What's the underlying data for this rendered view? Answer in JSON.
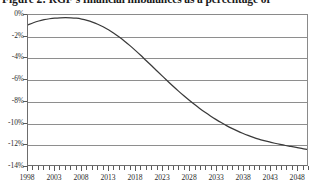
{
  "figure": {
    "title": "Figure 2: RGF's financial imbalances as a percentage of"
  },
  "chart_data": {
    "type": "line",
    "title": "Figure 2: RGF's financial imbalances as a percentage of",
    "xlabel": "",
    "ylabel": "",
    "xlim": [
      1998,
      2050
    ],
    "ylim": [
      -14,
      0
    ],
    "grid": true,
    "legend": null,
    "ytick_labels": [
      "0%",
      "-2%",
      "-4%",
      "-6%",
      "-8%",
      "-10%",
      "-12%",
      "-14%"
    ],
    "ytick_values": [
      0,
      -2,
      -4,
      -6,
      -8,
      -10,
      -12,
      -14
    ],
    "xtick_labels": [
      "1998",
      "2003",
      "2008",
      "2013",
      "2018",
      "2023",
      "2028",
      "2033",
      "2038",
      "2043",
      "2048"
    ],
    "xtick_values": [
      1998,
      2003,
      2008,
      2013,
      2018,
      2023,
      2028,
      2033,
      2038,
      2043,
      2048
    ],
    "x_minor_tick_step": 1,
    "line_color": "#3a3a3a",
    "grid_color": "#8e8e8e",
    "series": [
      {
        "name": "RGF financial imbalance",
        "x": [
          1998,
          1999,
          2000,
          2001,
          2002,
          2003,
          2004,
          2005,
          2006,
          2007,
          2008,
          2009,
          2010,
          2011,
          2012,
          2013,
          2014,
          2015,
          2016,
          2017,
          2018,
          2019,
          2020,
          2021,
          2022,
          2023,
          2024,
          2025,
          2026,
          2027,
          2028,
          2029,
          2030,
          2031,
          2032,
          2033,
          2034,
          2035,
          2036,
          2037,
          2038,
          2039,
          2040,
          2041,
          2042,
          2043,
          2044,
          2045,
          2046,
          2047,
          2048,
          2049,
          2050
        ],
        "values": [
          -0.92,
          -0.72,
          -0.56,
          -0.44,
          -0.35,
          -0.29,
          -0.26,
          -0.25,
          -0.26,
          -0.3,
          -0.38,
          -0.5,
          -0.66,
          -0.86,
          -1.1,
          -1.38,
          -1.7,
          -2.06,
          -2.45,
          -2.86,
          -3.3,
          -3.76,
          -4.24,
          -4.72,
          -5.2,
          -5.68,
          -6.16,
          -6.63,
          -7.08,
          -7.52,
          -7.94,
          -8.34,
          -8.72,
          -9.08,
          -9.42,
          -9.74,
          -10.04,
          -10.32,
          -10.58,
          -10.82,
          -11.04,
          -11.24,
          -11.42,
          -11.58,
          -11.72,
          -11.85,
          -11.97,
          -12.08,
          -12.18,
          -12.27,
          -12.36,
          -12.45,
          -12.55
        ]
      }
    ]
  }
}
